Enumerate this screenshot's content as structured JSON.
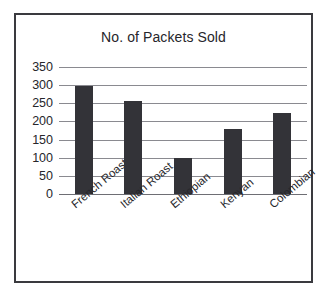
{
  "chart_data": {
    "type": "bar",
    "title": "No. of Packets Sold",
    "xlabel": "",
    "ylabel": "",
    "categories": [
      "French Roast",
      "Italian Roast",
      "Ethiopian",
      "Kenyan",
      "Colombian"
    ],
    "values": [
      298,
      257,
      98,
      178,
      222
    ],
    "ylim": [
      0,
      350
    ],
    "yticks": [
      0,
      50,
      100,
      150,
      200,
      250,
      300,
      350
    ],
    "ytick_labels": [
      "0",
      "50",
      "100",
      "150",
      "200",
      "250",
      "300",
      "350"
    ],
    "grid": true,
    "legend": null,
    "bar_color": "#333338",
    "gridline_color": "#8a8a90",
    "frame_color": "#3a3a3f",
    "background_color": "#ffffff"
  }
}
